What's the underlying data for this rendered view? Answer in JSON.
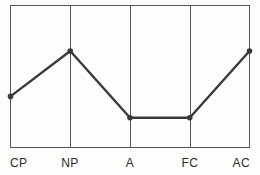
{
  "chart_data": {
    "type": "line",
    "title": "",
    "subtitle": "",
    "xlabel": "",
    "ylabel": "",
    "categories": [
      "CP",
      "NP",
      "A",
      "FC",
      "AC"
    ],
    "values": [
      36,
      68,
      21,
      21,
      68
    ],
    "series": [
      {
        "name": "egogram",
        "values": [
          36,
          68,
          21,
          21,
          68
        ]
      }
    ],
    "ylim": [
      0,
      100
    ],
    "xlim": [
      0,
      4
    ],
    "grid": "vertical-only",
    "legend": "none",
    "annotations": [],
    "line_color": "#3a3a3a",
    "marker_color": "#3a3a3a",
    "marker_shape": "circle",
    "frame_color": "#555555",
    "gridline_color": "#555555",
    "background_color": "#fdfdfc"
  },
  "axis": {
    "tick_labels": [
      "CP",
      "NP",
      "A",
      "FC",
      "AC"
    ]
  }
}
